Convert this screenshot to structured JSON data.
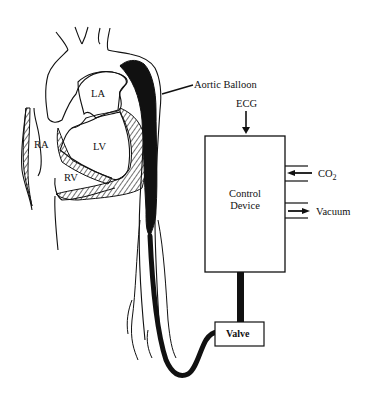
{
  "diagram": {
    "type": "schematic",
    "anatomy_labels": {
      "la": "LA",
      "lv": "LV",
      "ra": "RA",
      "rv": "RV"
    },
    "callouts": {
      "aortic_balloon": "Aortic Balloon"
    },
    "control_device": {
      "line1": "Control",
      "line2": "Device"
    },
    "inputs": {
      "ecg": "ECG",
      "co2": "CO",
      "co2_sub": "2",
      "vacuum": "Vacuum"
    },
    "valve": {
      "label": "Valve"
    },
    "colors": {
      "ink": "#111111",
      "background": "#ffffff"
    }
  }
}
